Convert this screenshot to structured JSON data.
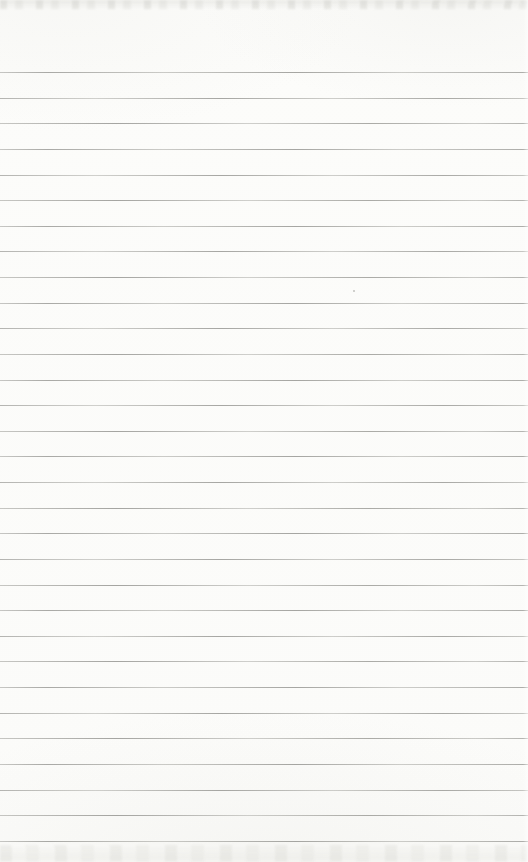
{
  "document": {
    "kind": "blank ruled notebook page (scanned)",
    "text_content": "",
    "paper": {
      "background_color": "#fbfbf9",
      "edge_tint_color": "#ccccc6"
    },
    "ruling": {
      "line_count": 31,
      "first_line_top_px": 72,
      "line_spacing_px": 25.63,
      "line_color": "#a9a9a6",
      "full_width": true
    },
    "artifacts": {
      "speck": {
        "left_px": 353,
        "top_px": 290,
        "color": "#c2c2be"
      }
    }
  }
}
